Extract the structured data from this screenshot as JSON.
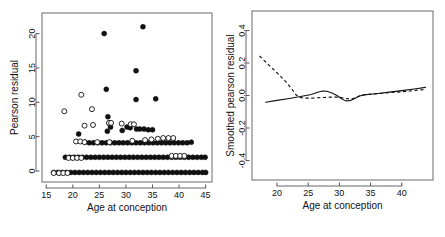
{
  "figure": {
    "width": 445,
    "height": 237,
    "background": "#ffffff",
    "foreground": "#111111",
    "panel_count": 2
  },
  "chart_data": [
    {
      "id": "left-panel",
      "type": "scatter",
      "title": "",
      "xlabel": "Age at conception",
      "ylabel": "Pearson residual",
      "xlim": [
        14.2,
        46.2
      ],
      "ylim": [
        -1.6,
        23.0
      ],
      "xticks": [
        15,
        20,
        25,
        30,
        35,
        40,
        45
      ],
      "xticklabels": [
        "15",
        "20",
        "25",
        "30",
        "35",
        "40",
        "45"
      ],
      "yticks": [
        0,
        5,
        10,
        15,
        20
      ],
      "yticklabels": [
        "0",
        "5",
        "10",
        "15",
        "20"
      ],
      "grid": false,
      "legend": null,
      "marker_types": [
        "filled-circle",
        "open-circle"
      ],
      "series": [
        {
          "name": "filled",
          "marker": "filled-circle",
          "points": [
            [
              25.9,
              20.0
            ],
            [
              33.2,
              21.0
            ],
            [
              31.9,
              14.6
            ],
            [
              26.3,
              11.9
            ],
            [
              31.9,
              10.4
            ],
            [
              35.6,
              10.5
            ],
            [
              26.6,
              7.9
            ],
            [
              26.9,
              6.9
            ],
            [
              27.1,
              6.4
            ],
            [
              26.5,
              5.8
            ],
            [
              29.3,
              5.9
            ],
            [
              21.1,
              5.4
            ],
            [
              32.0,
              6.1
            ],
            [
              32.6,
              6.1
            ],
            [
              33.4,
              6.1
            ],
            [
              34.2,
              6.0
            ],
            [
              35.0,
              6.0
            ],
            [
              30.8,
              6.3
            ],
            [
              30.2,
              6.4
            ],
            [
              22.3,
              4.2
            ],
            [
              23.1,
              4.1
            ],
            [
              23.9,
              4.1
            ],
            [
              24.7,
              4.1
            ],
            [
              25.5,
              4.1
            ],
            [
              26.3,
              4.1
            ],
            [
              27.1,
              4.1
            ],
            [
              27.9,
              4.1
            ],
            [
              28.7,
              4.1
            ],
            [
              29.5,
              4.1
            ],
            [
              30.3,
              4.1
            ],
            [
              31.1,
              4.1
            ],
            [
              31.9,
              4.1
            ],
            [
              32.7,
              4.1
            ],
            [
              33.5,
              4.1
            ],
            [
              34.3,
              4.1
            ],
            [
              35.1,
              4.1
            ],
            [
              35.9,
              4.1
            ],
            [
              36.7,
              4.1
            ],
            [
              37.5,
              4.1
            ],
            [
              38.3,
              4.1
            ],
            [
              39.1,
              4.1
            ],
            [
              39.9,
              4.1
            ],
            [
              40.7,
              4.1
            ],
            [
              41.5,
              4.1
            ],
            [
              42.3,
              4.2
            ],
            [
              18.6,
              2.0
            ],
            [
              19.4,
              2.0
            ],
            [
              20.2,
              2.0
            ],
            [
              21.0,
              2.0
            ],
            [
              21.8,
              2.0
            ],
            [
              22.6,
              2.0
            ],
            [
              23.4,
              2.0
            ],
            [
              24.2,
              2.0
            ],
            [
              25.0,
              2.0
            ],
            [
              25.8,
              2.0
            ],
            [
              26.6,
              2.0
            ],
            [
              27.4,
              2.0
            ],
            [
              28.2,
              2.0
            ],
            [
              29.0,
              2.0
            ],
            [
              29.8,
              2.0
            ],
            [
              30.6,
              2.0
            ],
            [
              31.4,
              2.0
            ],
            [
              32.2,
              2.0
            ],
            [
              33.0,
              2.0
            ],
            [
              33.8,
              2.0
            ],
            [
              34.6,
              2.0
            ],
            [
              35.4,
              2.0
            ],
            [
              36.2,
              2.0
            ],
            [
              37.0,
              2.0
            ],
            [
              37.8,
              2.0
            ],
            [
              38.6,
              2.0
            ],
            [
              39.4,
              2.0
            ],
            [
              40.2,
              2.0
            ],
            [
              41.0,
              2.0
            ],
            [
              41.8,
              2.0
            ],
            [
              42.6,
              2.0
            ],
            [
              43.4,
              2.0
            ],
            [
              44.2,
              2.0
            ],
            [
              44.9,
              2.0
            ],
            [
              16.4,
              -0.2
            ],
            [
              17.2,
              -0.2
            ],
            [
              18.0,
              -0.2
            ],
            [
              18.8,
              -0.2
            ],
            [
              19.6,
              -0.2
            ],
            [
              20.4,
              -0.2
            ],
            [
              21.2,
              -0.2
            ],
            [
              22.0,
              -0.2
            ],
            [
              22.8,
              -0.2
            ],
            [
              23.6,
              -0.2
            ],
            [
              24.4,
              -0.2
            ],
            [
              25.2,
              -0.2
            ],
            [
              26.0,
              -0.2
            ],
            [
              26.8,
              -0.2
            ],
            [
              27.6,
              -0.2
            ],
            [
              28.4,
              -0.2
            ],
            [
              29.2,
              -0.2
            ],
            [
              30.0,
              -0.2
            ],
            [
              30.8,
              -0.2
            ],
            [
              31.6,
              -0.2
            ],
            [
              32.4,
              -0.2
            ],
            [
              33.2,
              -0.2
            ],
            [
              34.0,
              -0.2
            ],
            [
              34.8,
              -0.2
            ],
            [
              35.6,
              -0.2
            ],
            [
              36.4,
              -0.2
            ],
            [
              37.2,
              -0.2
            ],
            [
              38.0,
              -0.2
            ],
            [
              38.8,
              -0.2
            ],
            [
              39.6,
              -0.2
            ],
            [
              40.4,
              -0.2
            ],
            [
              41.2,
              -0.2
            ],
            [
              42.0,
              -0.2
            ],
            [
              42.8,
              -0.2
            ],
            [
              43.6,
              -0.2
            ],
            [
              44.4,
              -0.2
            ],
            [
              45.0,
              -0.2
            ]
          ]
        },
        {
          "name": "open",
          "marker": "open-circle",
          "points": [
            [
              18.4,
              8.7
            ],
            [
              21.6,
              11.1
            ],
            [
              23.6,
              9.0
            ],
            [
              23.8,
              6.7
            ],
            [
              22.2,
              6.6
            ],
            [
              26.8,
              7.0
            ],
            [
              27.2,
              7.0
            ],
            [
              29.2,
              6.9
            ],
            [
              30.9,
              6.8
            ],
            [
              31.5,
              6.8
            ],
            [
              20.6,
              4.3
            ],
            [
              21.4,
              4.3
            ],
            [
              22.2,
              4.2
            ],
            [
              24.6,
              4.2
            ],
            [
              26.9,
              4.2
            ],
            [
              31.2,
              4.4
            ],
            [
              33.6,
              4.5
            ],
            [
              34.8,
              4.6
            ],
            [
              36.0,
              4.7
            ],
            [
              37.0,
              4.8
            ],
            [
              38.0,
              4.8
            ],
            [
              38.9,
              4.8
            ],
            [
              19.2,
              1.9
            ],
            [
              20.0,
              1.9
            ],
            [
              20.8,
              1.9
            ],
            [
              21.6,
              1.9
            ],
            [
              38.6,
              2.2
            ],
            [
              39.4,
              2.2
            ],
            [
              40.2,
              2.2
            ],
            [
              41.0,
              2.2
            ],
            [
              16.4,
              -0.3
            ],
            [
              17.4,
              -0.3
            ],
            [
              18.2,
              -0.3
            ],
            [
              19.0,
              -0.3
            ]
          ]
        }
      ]
    },
    {
      "id": "right-panel",
      "type": "line",
      "title": "",
      "xlabel": "Age at conception",
      "ylabel": "Smoothed pearson residual",
      "xlim": [
        16.0,
        45.0
      ],
      "ylim": [
        -0.52,
        0.52
      ],
      "xticks": [
        20,
        25,
        30,
        35,
        40
      ],
      "xticklabels": [
        "20",
        "25",
        "30",
        "35",
        "40"
      ],
      "yticks": [
        -0.4,
        -0.2,
        0.0,
        0.2,
        0.4
      ],
      "yticklabels": [
        "-0.4",
        "-0.2",
        "0.0",
        "0.2",
        "0.4"
      ],
      "grid": false,
      "legend": null,
      "series": [
        {
          "name": "solid-smoother",
          "style": "solid",
          "points": [
            [
              18.2,
              -0.042
            ],
            [
              20.0,
              -0.03
            ],
            [
              22.0,
              -0.018
            ],
            [
              24.0,
              -0.005
            ],
            [
              25.5,
              0.006
            ],
            [
              26.5,
              0.02
            ],
            [
              27.3,
              0.028
            ],
            [
              28.0,
              0.026
            ],
            [
              28.8,
              0.015
            ],
            [
              29.6,
              0.0
            ],
            [
              30.3,
              -0.018
            ],
            [
              31.0,
              -0.033
            ],
            [
              31.7,
              -0.032
            ],
            [
              32.4,
              -0.02
            ],
            [
              33.2,
              -0.003
            ],
            [
              34.0,
              0.004
            ],
            [
              35.0,
              0.008
            ],
            [
              36.5,
              0.014
            ],
            [
              38.0,
              0.021
            ],
            [
              40.0,
              0.03
            ],
            [
              42.0,
              0.04
            ],
            [
              43.8,
              0.05
            ]
          ]
        },
        {
          "name": "dashed-smoother",
          "style": "dashed",
          "points": [
            [
              17.2,
              0.243
            ],
            [
              18.5,
              0.195
            ],
            [
              20.0,
              0.14
            ],
            [
              21.3,
              0.09
            ],
            [
              22.3,
              0.044
            ],
            [
              23.0,
              0.006
            ],
            [
              23.6,
              -0.012
            ],
            [
              24.5,
              -0.016
            ],
            [
              25.5,
              -0.016
            ],
            [
              26.5,
              -0.014
            ],
            [
              27.5,
              -0.012
            ],
            [
              28.5,
              -0.01
            ],
            [
              29.5,
              -0.01
            ],
            [
              30.3,
              -0.012
            ],
            [
              31.0,
              -0.018
            ],
            [
              31.8,
              -0.022
            ],
            [
              32.6,
              -0.014
            ],
            [
              33.4,
              0.0
            ],
            [
              34.2,
              0.006
            ],
            [
              35.5,
              0.01
            ],
            [
              37.0,
              0.014
            ],
            [
              39.0,
              0.02
            ],
            [
              41.0,
              0.026
            ],
            [
              42.8,
              0.034
            ],
            [
              43.6,
              0.036
            ]
          ]
        }
      ]
    }
  ]
}
